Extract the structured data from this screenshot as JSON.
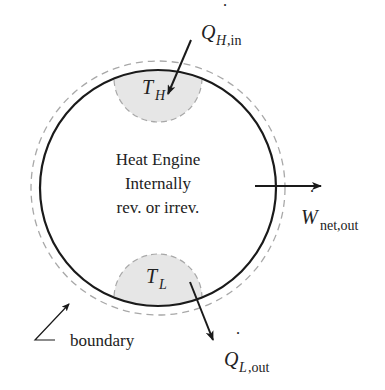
{
  "diagram": {
    "title": "Heat Engine",
    "engine_label": {
      "line1": "Heat Engine",
      "line2": "Internally",
      "line3": "rev. or irrev."
    },
    "hot_reservoir": {
      "symbol": "T",
      "subscript": "H"
    },
    "cold_reservoir": {
      "symbol": "T",
      "subscript": "L"
    },
    "heat_in": {
      "symbol": "Q",
      "subscript": "H,in",
      "dot": "˙"
    },
    "heat_out": {
      "symbol": "Q",
      "subscript": "L,out",
      "dot": "˙"
    },
    "work_out": {
      "symbol": "W",
      "subscript": "net,out",
      "dot": "˙"
    },
    "boundary_label": "boundary",
    "colors": {
      "stroke": "#1a1a1a",
      "dashed": "#a8a8a8",
      "reservoir_fill": "#e6e6e6",
      "text": "#222222"
    }
  }
}
